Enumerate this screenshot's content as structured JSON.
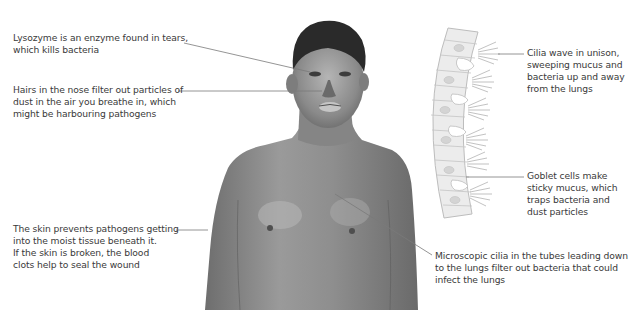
{
  "diagram": {
    "labels": {
      "lysozyme": [
        "Lysozyme is an enzyme found in tears,",
        "which kills bacteria"
      ],
      "nose_hairs": [
        "Hairs in the nose filter out particles of",
        "dust in the air you breathe in, which",
        "might be harbouring pathogens"
      ],
      "skin": [
        "The skin prevents pathogens getting",
        "into the moist tissue beneath it.",
        "If the skin is broken, the blood",
        "clots help to seal the wound"
      ],
      "cilia_wave": [
        "Cilia wave in unison,",
        "sweeping mucus and",
        "bacteria up and away",
        "from the lungs"
      ],
      "goblet_cells": [
        "Goblet cells make",
        "sticky mucus, which",
        "traps bacteria and",
        "dust particles"
      ],
      "microscopic_cilia": [
        "Microscopic cilia in the tubes leading down",
        "to the lungs filter out bacteria that could",
        "infect the lungs"
      ]
    },
    "colors": {
      "text": "#3a3a3a",
      "leader_line": "#7a7a7a",
      "skin_tone": "#8a8a8a",
      "hair": "#2a2a2a",
      "cell_fill": "#ececec",
      "cell_stroke": "#bdbdbd"
    }
  }
}
